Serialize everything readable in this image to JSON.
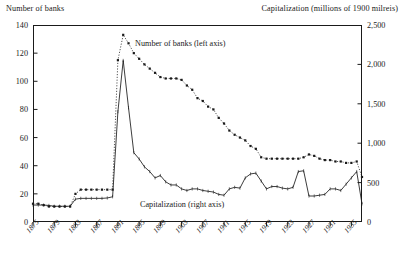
{
  "titles": {
    "left_axis": "Number of banks",
    "right_axis": "Capitalization (millions of 1900 milreis)"
  },
  "legend": {
    "banks": "Number of banks (left axis)",
    "capitalization": "Capitalization (right axis)"
  },
  "axes": {
    "left_ticks": [
      "0",
      "20",
      "40",
      "60",
      "80",
      "100",
      "120",
      "140"
    ],
    "right_ticks": [
      "0",
      "500",
      "1,000",
      "1,500",
      "2,000",
      "2,500"
    ],
    "x_ticks": [
      "1875",
      "1879",
      "1883",
      "1887",
      "1891",
      "1895",
      "1899",
      "1903",
      "1907",
      "1911",
      "1915",
      "1919",
      "1923",
      "1927",
      "1931",
      "1935"
    ]
  },
  "chart_data": {
    "type": "line",
    "title": "",
    "subtitle": "",
    "xlabel": "",
    "ylabel": "Number of banks",
    "y2label": "Capitalization (millions of 1900 milreis)",
    "xlim": [
      1875,
      1937
    ],
    "ylim": [
      0,
      140
    ],
    "y2lim": [
      0,
      2500
    ],
    "grid": false,
    "legend_position": "inline-annotations",
    "x": [
      1875,
      1876,
      1877,
      1878,
      1879,
      1880,
      1881,
      1882,
      1883,
      1884,
      1885,
      1886,
      1887,
      1888,
      1889,
      1890,
      1891,
      1892,
      1893,
      1894,
      1895,
      1896,
      1897,
      1898,
      1899,
      1900,
      1901,
      1902,
      1903,
      1904,
      1905,
      1906,
      1907,
      1908,
      1909,
      1910,
      1911,
      1912,
      1913,
      1914,
      1915,
      1916,
      1917,
      1918,
      1919,
      1920,
      1921,
      1922,
      1923,
      1924,
      1925,
      1926,
      1927,
      1928,
      1929,
      1930,
      1931,
      1932,
      1933,
      1934,
      1935,
      1936,
      1937
    ],
    "series": [
      {
        "name": "Number of banks (left axis)",
        "axis": "left",
        "style": "dotted-with-markers",
        "values": [
          13,
          13,
          12,
          11,
          11,
          11,
          11,
          11,
          20,
          23,
          23,
          23,
          23,
          23,
          23,
          23,
          115,
          133,
          127,
          120,
          116,
          112,
          109,
          106,
          103,
          102,
          102,
          102,
          101,
          97,
          94,
          88,
          86,
          82,
          80,
          74,
          70,
          65,
          62,
          60,
          58,
          54,
          52,
          46,
          45,
          45,
          45,
          45,
          45,
          45,
          45,
          46,
          48,
          47,
          45,
          44,
          44,
          43,
          43,
          42,
          42,
          43,
          32
        ]
      },
      {
        "name": "Capitalization (right axis)",
        "axis": "right",
        "style": "solid-with-ticks",
        "values": [
          215,
          215,
          215,
          210,
          200,
          200,
          200,
          200,
          290,
          300,
          300,
          300,
          300,
          300,
          305,
          320,
          1400,
          2050,
          1450,
          880,
          800,
          700,
          640,
          560,
          590,
          510,
          470,
          470,
          420,
          400,
          420,
          420,
          400,
          390,
          380,
          350,
          340,
          420,
          440,
          430,
          560,
          610,
          620,
          520,
          420,
          450,
          450,
          430,
          420,
          440,
          640,
          650,
          330,
          330,
          340,
          350,
          420,
          420,
          400,
          480,
          560,
          640,
          230
        ]
      }
    ]
  }
}
